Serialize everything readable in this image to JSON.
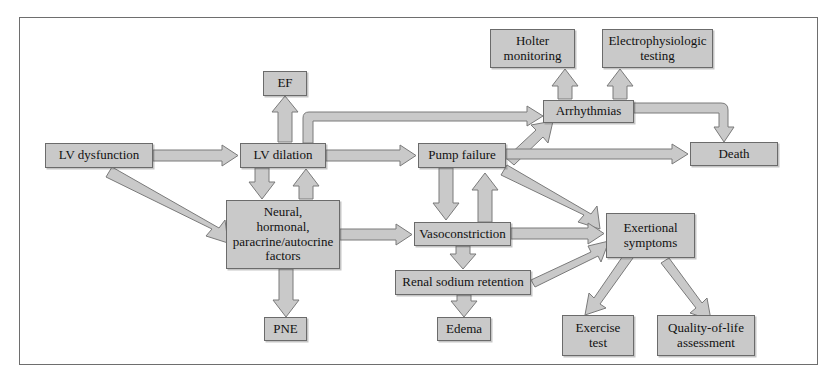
{
  "diagram": {
    "frame_color": "#6e6e6e",
    "node_fill": "#c9c9c9",
    "node_border": "#6b6b6b",
    "arrow_fill": "#c9c9c9",
    "arrow_stroke": "#7a7a7a",
    "nodes": [
      {
        "id": "lv-dysfunction",
        "label": "LV dysfunction",
        "x": 45,
        "y": 143,
        "w": 108,
        "h": 25
      },
      {
        "id": "lv-dilation",
        "label": "LV dilation",
        "x": 240,
        "y": 143,
        "w": 86,
        "h": 25
      },
      {
        "id": "ef",
        "label": "EF",
        "x": 263,
        "y": 71,
        "w": 44,
        "h": 25
      },
      {
        "id": "neural-factors",
        "label": "Neural,\nhormonal,\nparacrine/autocrine\nfactors",
        "x": 226,
        "y": 200,
        "w": 114,
        "h": 69
      },
      {
        "id": "pne",
        "label": "PNE",
        "x": 264,
        "y": 317,
        "w": 43,
        "h": 24
      },
      {
        "id": "pump-failure",
        "label": "Pump failure",
        "x": 418,
        "y": 143,
        "w": 88,
        "h": 25
      },
      {
        "id": "vasoconstriction",
        "label": "Vasoconstriction",
        "x": 414,
        "y": 222,
        "w": 97,
        "h": 24
      },
      {
        "id": "renal-sodium-retention",
        "label": "Renal sodium retention",
        "x": 395,
        "y": 270,
        "w": 136,
        "h": 25
      },
      {
        "id": "edema",
        "label": "Edema",
        "x": 437,
        "y": 317,
        "w": 54,
        "h": 24
      },
      {
        "id": "arrhythmias",
        "label": "Arrhythmias",
        "x": 543,
        "y": 100,
        "w": 91,
        "h": 23
      },
      {
        "id": "holter-monitoring",
        "label": "Holter\nmonitoring",
        "x": 490,
        "y": 29,
        "w": 85,
        "h": 39
      },
      {
        "id": "electrophysiologic-testing",
        "label": "Electrophysiologic\ntesting",
        "x": 602,
        "y": 29,
        "w": 111,
        "h": 39
      },
      {
        "id": "death",
        "label": "Death",
        "x": 690,
        "y": 142,
        "w": 88,
        "h": 24
      },
      {
        "id": "exertional-symptoms",
        "label": "Exertional\nsymptoms",
        "x": 606,
        "y": 213,
        "w": 89,
        "h": 45
      },
      {
        "id": "exercise-test",
        "label": "Exercise\ntest",
        "x": 562,
        "y": 315,
        "w": 72,
        "h": 41
      },
      {
        "id": "quality-of-life-assessment",
        "label": "Quality-of-life\nassessment",
        "x": 657,
        "y": 315,
        "w": 98,
        "h": 41
      }
    ],
    "edges": [
      {
        "id": "lv-dysfunction-to-lv-dilation",
        "from": "lv-dysfunction",
        "to": "lv-dilation",
        "kind": "straight-right"
      },
      {
        "id": "lv-dysfunction-to-neural",
        "from": "lv-dysfunction",
        "to": "neural-factors",
        "kind": "diagonal"
      },
      {
        "id": "lv-dilation-to-ef",
        "from": "lv-dilation",
        "to": "ef",
        "kind": "straight-up"
      },
      {
        "id": "lv-dilation-to-neural",
        "from": "lv-dilation",
        "to": "neural-factors",
        "kind": "straight-down"
      },
      {
        "id": "neural-to-lv-dilation",
        "from": "neural-factors",
        "to": "lv-dilation",
        "kind": "straight-up"
      },
      {
        "id": "neural-to-pne",
        "from": "neural-factors",
        "to": "pne",
        "kind": "straight-down"
      },
      {
        "id": "neural-to-vasoconstriction",
        "from": "neural-factors",
        "to": "vasoconstriction",
        "kind": "straight-right"
      },
      {
        "id": "lv-dilation-to-pump-failure",
        "from": "lv-dilation",
        "to": "pump-failure",
        "kind": "straight-right"
      },
      {
        "id": "lv-dilation-to-arrhythmias",
        "from": "lv-dilation",
        "to": "arrhythmias",
        "kind": "elbow-up-right"
      },
      {
        "id": "pump-failure-to-arrhythmias",
        "from": "pump-failure",
        "to": "arrhythmias",
        "kind": "diagonal"
      },
      {
        "id": "pump-failure-to-death",
        "from": "pump-failure",
        "to": "death",
        "kind": "straight-right"
      },
      {
        "id": "pump-failure-to-vasoconstriction",
        "from": "pump-failure",
        "to": "vasoconstriction",
        "kind": "straight-down"
      },
      {
        "id": "vasoconstriction-to-pump-failure",
        "from": "vasoconstriction",
        "to": "pump-failure",
        "kind": "straight-up"
      },
      {
        "id": "pump-failure-to-exertional",
        "from": "pump-failure",
        "to": "exertional-symptoms",
        "kind": "diagonal"
      },
      {
        "id": "arrhythmias-to-holter",
        "from": "arrhythmias",
        "to": "holter-monitoring",
        "kind": "straight-up"
      },
      {
        "id": "arrhythmias-to-eptesting",
        "from": "arrhythmias",
        "to": "electrophysiologic-testing",
        "kind": "straight-up"
      },
      {
        "id": "arrhythmias-to-death",
        "from": "arrhythmias",
        "to": "death",
        "kind": "elbow-right-down"
      },
      {
        "id": "vasoconstriction-to-renal",
        "from": "vasoconstriction",
        "to": "renal-sodium-retention",
        "kind": "straight-down"
      },
      {
        "id": "vasoconstriction-to-exertional",
        "from": "vasoconstriction",
        "to": "exertional-symptoms",
        "kind": "straight-right"
      },
      {
        "id": "renal-to-edema",
        "from": "renal-sodium-retention",
        "to": "edema",
        "kind": "straight-down"
      },
      {
        "id": "renal-to-exertional",
        "from": "renal-sodium-retention",
        "to": "exertional-symptoms",
        "kind": "diagonal"
      },
      {
        "id": "exertional-to-exercise-test",
        "from": "exertional-symptoms",
        "to": "exercise-test",
        "kind": "diagonal"
      },
      {
        "id": "exertional-to-quality-of-life",
        "from": "exertional-symptoms",
        "to": "quality-of-life-assessment",
        "kind": "diagonal"
      }
    ]
  }
}
